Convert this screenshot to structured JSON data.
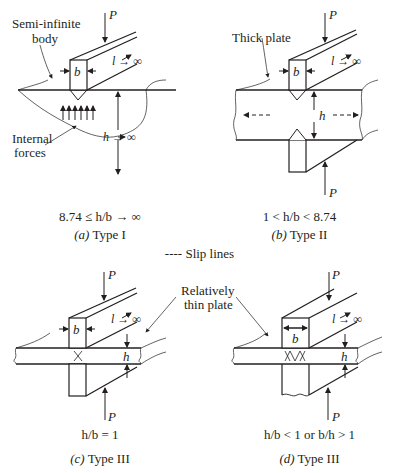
{
  "figure": {
    "legend": {
      "symbol": "----",
      "label": "Slip lines"
    },
    "panels": [
      {
        "id": "a",
        "callouts": [
          "Semi-infinite",
          "body",
          "Internal",
          "forces"
        ],
        "symbols": {
          "load": "P",
          "width": "b",
          "length": "l → ∞",
          "height": "h → ∞"
        },
        "condition": "8.74 ≤ h/b → ∞",
        "caption_letter": "(a)",
        "caption_text": "Type I"
      },
      {
        "id": "b",
        "callouts": [
          "Thick plate"
        ],
        "symbols": {
          "load_top": "P",
          "load_bottom": "P",
          "width": "b",
          "length": "l → ∞",
          "height": "h"
        },
        "condition": "1 < h/b < 8.74",
        "caption_letter": "(b)",
        "caption_text": "Type II"
      },
      {
        "id": "c",
        "callouts": [
          "Relatively",
          "thin plate"
        ],
        "symbols": {
          "load_top": "P",
          "load_bottom": "P",
          "width": "b",
          "length": "l → ∞",
          "height": "h"
        },
        "condition": "h/b = 1",
        "caption_letter": "(c)",
        "caption_text": "Type III"
      },
      {
        "id": "d",
        "symbols": {
          "load_top": "P",
          "load_bottom": "P",
          "width": "b",
          "length": "l → ∞",
          "height": "h"
        },
        "condition": "h/b < 1  or  b/h > 1",
        "caption_letter": "(d)",
        "caption_text": "Type III"
      }
    ]
  }
}
